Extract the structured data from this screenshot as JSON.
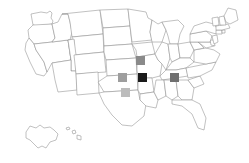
{
  "map": {
    "title": "United States state outline map with shaded square markers",
    "background_color": "#ffffff",
    "border_color": "#8d8d8d",
    "state_fill": "#ffffff",
    "projection_note": "Contiguous US with Alaska and Hawaii insets at lower left",
    "insets": [
      {
        "name": "Alaska",
        "label": "AK"
      },
      {
        "name": "Hawaii",
        "label": "HI"
      }
    ]
  },
  "markers": [
    {
      "name": "iowa-marker",
      "state": "Iowa",
      "color": "#8a8a8a",
      "x": 136,
      "y": 56,
      "size": 9,
      "shade": "medium-gray"
    },
    {
      "name": "kansas-marker",
      "state": "Kansas",
      "color": "#9e9e9e",
      "x": 118,
      "y": 73,
      "size": 9,
      "shade": "gray"
    },
    {
      "name": "missouri-marker",
      "state": "Missouri",
      "color": "#1a1a1a",
      "x": 138,
      "y": 73,
      "size": 9,
      "shade": "black"
    },
    {
      "name": "oklahoma-marker",
      "state": "Oklahoma",
      "color": "#bcbcbc",
      "x": 121,
      "y": 88,
      "size": 9,
      "shade": "light-gray"
    },
    {
      "name": "tennessee-marker",
      "state": "Tennessee",
      "color": "#6f6f6f",
      "x": 170,
      "y": 73,
      "size": 9,
      "shade": "dark-gray"
    }
  ]
}
